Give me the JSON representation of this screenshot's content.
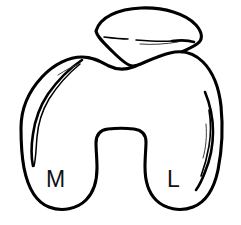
{
  "figure": {
    "background_color": "#ffffff",
    "line_color": "#000000",
    "width": 241,
    "height": 225
  },
  "labels": {
    "medial": "M",
    "lateral": "L"
  },
  "structures": {
    "patella_name": "patella",
    "femur_name": "distal-femur",
    "notch_name": "intercondylar-notch",
    "medial_condyle_name": "medial-condyle",
    "lateral_condyle_name": "lateral-condyle",
    "trochlear_groove_name": "trochlear-groove"
  }
}
